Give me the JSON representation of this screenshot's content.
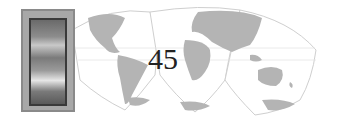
{
  "page": {
    "number": "45"
  },
  "decoration": {
    "map_icon": "world-map-interrupted-projection",
    "photo_icon": "framed-portrait-photo",
    "colors": {
      "land": "#b4b4b4",
      "outline": "#cfcfcf",
      "frame": "#a8a8a8",
      "text": "#222222"
    }
  }
}
